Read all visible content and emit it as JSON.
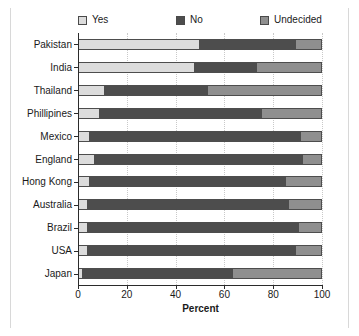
{
  "chart_data": {
    "type": "bar",
    "orientation": "horizontal",
    "stacked": true,
    "title": "",
    "xlabel": "Percent",
    "ylabel": "",
    "xlim": [
      0,
      100
    ],
    "xticks": [
      0,
      20,
      40,
      60,
      80,
      100
    ],
    "grid": true,
    "legend_position": "top",
    "categories": [
      "Pakistan",
      "India",
      "Thailand",
      "Phillipines",
      "Mexico",
      "England",
      "Hong Kong",
      "Australia",
      "Brazil",
      "USA",
      "Japan"
    ],
    "series": [
      {
        "name": "Yes",
        "color": "#dcdcdc",
        "values": [
          50,
          48,
          11,
          9,
          5,
          7,
          5,
          4,
          4,
          4,
          2
        ]
      },
      {
        "name": "No",
        "color": "#4d4d4d",
        "values": [
          39,
          25,
          42,
          66,
          86,
          85,
          80,
          82,
          86,
          85,
          61
        ]
      },
      {
        "name": "Undecided",
        "color": "#8f8f8f",
        "values": [
          11,
          27,
          47,
          25,
          9,
          8,
          15,
          14,
          10,
          11,
          37
        ]
      }
    ]
  },
  "legend": {
    "items": [
      {
        "label": "Yes",
        "color": "#dcdcdc"
      },
      {
        "label": "No",
        "color": "#4d4d4d"
      },
      {
        "label": "Undecided",
        "color": "#8f8f8f"
      }
    ]
  },
  "axes": {
    "x_title": "Percent",
    "x_tick_labels": [
      "0",
      "20",
      "40",
      "60",
      "80",
      "100"
    ],
    "y_tick_labels": [
      "Pakistan",
      "India",
      "Thailand",
      "Phillipines",
      "Mexico",
      "England",
      "Hong Kong",
      "Australia",
      "Brazil",
      "USA",
      "Japan"
    ]
  }
}
